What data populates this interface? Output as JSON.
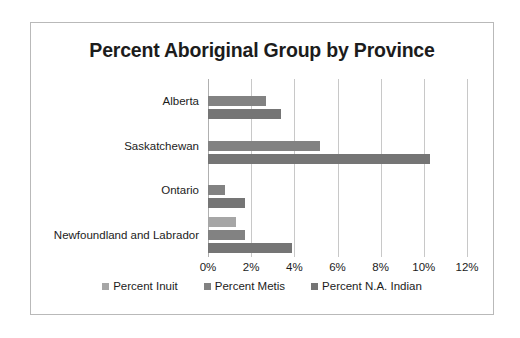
{
  "chart_data": {
    "type": "bar",
    "orientation": "horizontal",
    "title": "Percent Aboriginal Group by Province",
    "xlabel": "",
    "ylabel": "",
    "xlim": [
      0,
      12
    ],
    "xticks": [
      "0%",
      "2%",
      "4%",
      "6%",
      "8%",
      "10%",
      "12%"
    ],
    "xtick_values": [
      0,
      2,
      4,
      6,
      8,
      10,
      12
    ],
    "grid": true,
    "legend_position": "bottom",
    "categories": [
      "Alberta",
      "Saskatchewan",
      "Ontario",
      "Newfoundland and Labrador"
    ],
    "series": [
      {
        "name": "Percent Inuit",
        "color": "#a6a6a6",
        "values": [
          0,
          0,
          0,
          1.3
        ]
      },
      {
        "name": "Percent Metis",
        "color": "#828282",
        "values": [
          2.7,
          5.2,
          0.8,
          1.7
        ]
      },
      {
        "name": "Percent N.A. Indian",
        "color": "#757575",
        "values": [
          3.4,
          10.3,
          1.7,
          3.9
        ]
      }
    ]
  },
  "colors": {
    "frame_border": "#b9b9b9",
    "gridline": "#c8c8c8",
    "axis_line": "#b0b0b0",
    "text": "#1c1c1c",
    "background": "#ffffff"
  }
}
